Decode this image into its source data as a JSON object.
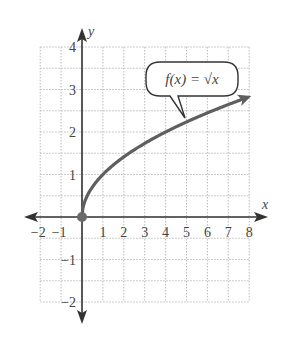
{
  "chart_data": {
    "type": "line",
    "title": "",
    "xlabel": "x",
    "ylabel": "y",
    "xlim": [
      -2,
      8
    ],
    "ylim": [
      -2,
      4
    ],
    "x_ticks": [
      "-2",
      "-1",
      "1",
      "2",
      "3",
      "4",
      "5",
      "6",
      "7",
      "8"
    ],
    "y_ticks": [
      "4",
      "3",
      "2",
      "1",
      "-1",
      "-2"
    ],
    "grid": true,
    "grid_style": "dotted",
    "series": [
      {
        "name": "f(x) = √x",
        "x": [
          0,
          0.25,
          0.5,
          1,
          2,
          3,
          4,
          5,
          6,
          7,
          8
        ],
        "values": [
          0,
          0.5,
          0.71,
          1,
          1.41,
          1.73,
          2,
          2.24,
          2.45,
          2.65,
          2.83
        ],
        "start_point": [
          0,
          0
        ],
        "end_arrow": true
      }
    ],
    "annotations": [
      {
        "text": "f(x) = √x",
        "type": "callout",
        "points_to": [
          4.8,
          2.2
        ]
      }
    ]
  },
  "labels": {
    "x_axis": "x",
    "y_axis": "y",
    "callout": "f(x) = √x"
  },
  "colors": {
    "axis": "#333333",
    "curve": "#5f5f5f",
    "grid": "#bbbbbb",
    "point": "#6a6a6a"
  }
}
